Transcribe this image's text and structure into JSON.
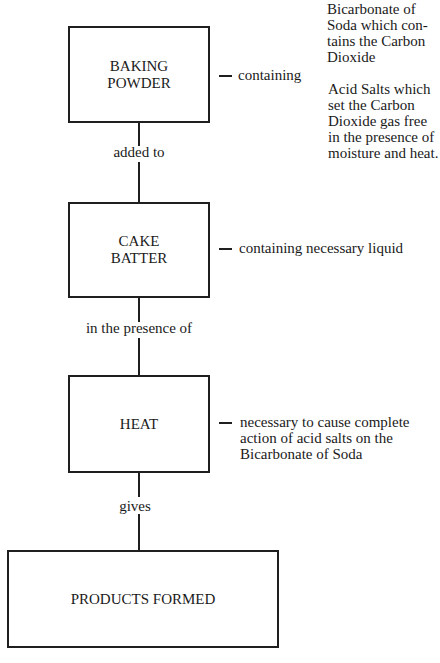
{
  "diagram": {
    "type": "flowchart",
    "nodes": [
      {
        "id": "baking_powder",
        "label_lines": [
          "BAKING",
          "POWDER"
        ]
      },
      {
        "id": "cake_batter",
        "label_lines": [
          "CAKE",
          "BATTER"
        ]
      },
      {
        "id": "heat",
        "label_lines": [
          "HEAT"
        ]
      },
      {
        "id": "products_formed",
        "label_lines": [
          "PRODUCTS FORMED"
        ]
      }
    ],
    "edges": [
      {
        "from": "baking_powder",
        "to": "cake_batter",
        "label": "added to"
      },
      {
        "from": "cake_batter",
        "to": "heat",
        "label": "in the presence of"
      },
      {
        "from": "heat",
        "to": "products_formed",
        "label": "gives"
      }
    ],
    "annotations": {
      "baking_powder": {
        "lead": "containing",
        "items": [
          {
            "lines": [
              "Bicarbonate of",
              "Soda which con-",
              "tains the Carbon",
              "Dioxide"
            ]
          },
          {
            "lines": [
              "Acid Salts which",
              "set the Carbon",
              "Dioxide gas free",
              "in the presence of",
              "moisture and heat."
            ]
          }
        ]
      },
      "cake_batter": {
        "lines": [
          "containing necessary liquid"
        ]
      },
      "heat": {
        "lines": [
          "necessary to cause complete",
          "action of acid salts on the",
          "Bicarbonate of Soda"
        ]
      }
    }
  }
}
